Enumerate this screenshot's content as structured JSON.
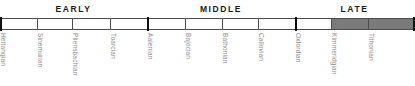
{
  "chart_data": {
    "type": "table",
    "xlabel": "",
    "ylabel": "",
    "epochs": [
      {
        "label": "EARLY",
        "start_px": 0,
        "end_px": 147
      },
      {
        "label": "MIDDLE",
        "start_px": 147,
        "end_px": 295
      },
      {
        "label": "LATE",
        "start_px": 295,
        "end_px": 414
      }
    ],
    "categories": [
      "Hettangian",
      "Sinemurian",
      "Pliensbachian",
      "Toarcian",
      "Aalenian",
      "Bajocian",
      "Bathonian",
      "Callovian",
      "Oxfordian",
      "Kimmeridgian",
      "Tithonian"
    ],
    "stages": [
      {
        "name": "Hettangian",
        "epoch": "EARLY",
        "start_px": 0,
        "end_px": 37,
        "shaded": false
      },
      {
        "name": "Sinemurian",
        "epoch": "EARLY",
        "start_px": 37,
        "end_px": 72,
        "shaded": false
      },
      {
        "name": "Pliensbachian",
        "epoch": "EARLY",
        "start_px": 72,
        "end_px": 110,
        "shaded": false
      },
      {
        "name": "Toarcian",
        "epoch": "EARLY",
        "start_px": 110,
        "end_px": 147,
        "shaded": false
      },
      {
        "name": "Aalenian",
        "epoch": "MIDDLE",
        "start_px": 147,
        "end_px": 185,
        "shaded": false
      },
      {
        "name": "Bajocian",
        "epoch": "MIDDLE",
        "start_px": 185,
        "end_px": 222,
        "shaded": false
      },
      {
        "name": "Bathonian",
        "epoch": "MIDDLE",
        "start_px": 222,
        "end_px": 258,
        "shaded": false
      },
      {
        "name": "Callovian",
        "epoch": "MIDDLE",
        "start_px": 258,
        "end_px": 295,
        "shaded": false
      },
      {
        "name": "Oxfordian",
        "epoch": "LATE",
        "start_px": 295,
        "end_px": 331,
        "shaded": false
      },
      {
        "name": "Kimmeridgian",
        "epoch": "LATE",
        "start_px": 331,
        "end_px": 368,
        "shaded": true
      },
      {
        "name": "Tithonian",
        "epoch": "LATE",
        "start_px": 368,
        "end_px": 414,
        "shaded": true
      }
    ],
    "boundary_ticks": [
      {
        "px": 0,
        "weight": "terminal"
      },
      {
        "px": 37,
        "weight": "minor"
      },
      {
        "px": 72,
        "weight": "minor"
      },
      {
        "px": 110,
        "weight": "minor"
      },
      {
        "px": 147,
        "weight": "major"
      },
      {
        "px": 185,
        "weight": "minor"
      },
      {
        "px": 222,
        "weight": "minor"
      },
      {
        "px": 258,
        "weight": "minor"
      },
      {
        "px": 295,
        "weight": "major"
      },
      {
        "px": 331,
        "weight": "minor"
      },
      {
        "px": 368,
        "weight": "minor"
      },
      {
        "px": 413,
        "weight": "terminal"
      }
    ],
    "colors": {
      "shaded_fill": "#7a7a7a",
      "unshaded_fill": "#ffffff",
      "bar_outline": "#4d4d4d",
      "epoch_text": "#1a1a1a",
      "stage_text": "#8c8c8c",
      "major_tick": "#111111"
    },
    "grid": false,
    "legend": null
  }
}
